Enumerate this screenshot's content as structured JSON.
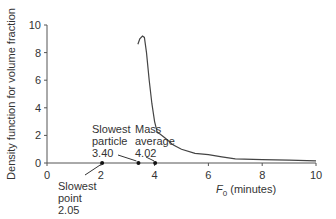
{
  "chart_data": {
    "type": "line",
    "title": "",
    "xlabel": "F0 (minutes)",
    "xlabel_main": "F",
    "xlabel_sub": "0",
    "xlabel_rest": " (minutes)",
    "ylabel": "Density function for volume fraction",
    "xlim": [
      0,
      10
    ],
    "ylim": [
      0,
      10
    ],
    "x_ticks": [
      "0",
      "2",
      "4",
      "6",
      "8",
      "10"
    ],
    "y_ticks": [
      "0",
      "2",
      "4",
      "6",
      "8",
      "10"
    ],
    "grid": false,
    "legend": null,
    "series": [
      {
        "name": "density",
        "x": [
          3.38,
          3.45,
          3.55,
          3.62,
          3.7,
          3.8,
          3.9,
          4.0,
          4.1,
          4.2,
          4.4,
          4.7,
          5.0,
          5.5,
          6.0,
          6.5,
          7.0,
          8.0,
          9.0,
          10.0
        ],
        "y": [
          8.6,
          9.0,
          9.2,
          9.1,
          8.0,
          6.0,
          4.3,
          3.0,
          2.2,
          2.1,
          1.8,
          1.3,
          1.0,
          0.7,
          0.6,
          0.45,
          0.3,
          0.25,
          0.2,
          0.15
        ]
      }
    ],
    "annotations": [
      {
        "label_lines": [
          "Slowest",
          "point",
          "2.05"
        ],
        "x": 2.05,
        "y": 0
      },
      {
        "label_lines": [
          "Slowest",
          "particle",
          "3.40"
        ],
        "x": 3.4,
        "y": 0
      },
      {
        "label_lines": [
          "Mass",
          "average",
          "4.02"
        ],
        "x": 4.02,
        "y": 0
      }
    ]
  }
}
